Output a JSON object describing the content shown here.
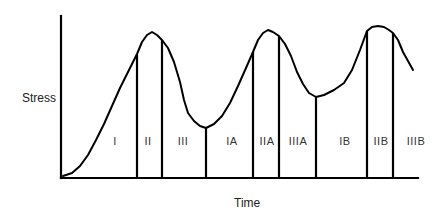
{
  "diagram": {
    "title": "",
    "y_axis_label": "Stress",
    "x_axis_label": "Time",
    "line_color": "#000000",
    "text_color": "#222222",
    "axes": {
      "origin": [
        61,
        178
      ],
      "y_axis_top": [
        61,
        16
      ],
      "x_axis_end": [
        418,
        178
      ]
    },
    "curve_points": [
      [
        63,
        176
      ],
      [
        72,
        173
      ],
      [
        80,
        166
      ],
      [
        88,
        155
      ],
      [
        96,
        140
      ],
      [
        104,
        124
      ],
      [
        112,
        106
      ],
      [
        120,
        88
      ],
      [
        128,
        72
      ],
      [
        134,
        60
      ],
      [
        137,
        54
      ],
      [
        142,
        42
      ],
      [
        147,
        35
      ],
      [
        152,
        32
      ],
      [
        157,
        35
      ],
      [
        162,
        40
      ],
      [
        168,
        48
      ],
      [
        174,
        62
      ],
      [
        180,
        82
      ],
      [
        184,
        100
      ],
      [
        188,
        113
      ],
      [
        194,
        121
      ],
      [
        200,
        126
      ],
      [
        206,
        128
      ],
      [
        214,
        124
      ],
      [
        222,
        116
      ],
      [
        230,
        103
      ],
      [
        238,
        86
      ],
      [
        246,
        68
      ],
      [
        253,
        52
      ],
      [
        258,
        40
      ],
      [
        263,
        33
      ],
      [
        268,
        30
      ],
      [
        273,
        32
      ],
      [
        279,
        36
      ],
      [
        285,
        44
      ],
      [
        291,
        56
      ],
      [
        297,
        72
      ],
      [
        303,
        84
      ],
      [
        309,
        93
      ],
      [
        316,
        97
      ],
      [
        324,
        95
      ],
      [
        334,
        90
      ],
      [
        344,
        83
      ],
      [
        352,
        70
      ],
      [
        360,
        50
      ],
      [
        367,
        31
      ],
      [
        372,
        27
      ],
      [
        378,
        26
      ],
      [
        384,
        27
      ],
      [
        389,
        30
      ],
      [
        393,
        33
      ],
      [
        398,
        40
      ],
      [
        403,
        52
      ],
      [
        408,
        61
      ],
      [
        413,
        70
      ]
    ],
    "dividers": [
      {
        "x": 137,
        "top": 54
      },
      {
        "x": 162,
        "top": 40
      },
      {
        "x": 206,
        "top": 128
      },
      {
        "x": 253,
        "top": 52
      },
      {
        "x": 279,
        "top": 36
      },
      {
        "x": 316,
        "top": 97
      },
      {
        "x": 367,
        "top": 31
      },
      {
        "x": 393,
        "top": 33
      }
    ],
    "phases": [
      {
        "label": "I",
        "x": 115
      },
      {
        "label": "II",
        "x": 148
      },
      {
        "label": "III",
        "x": 183
      },
      {
        "label": "IA",
        "x": 232
      },
      {
        "label": "IIA",
        "x": 267
      },
      {
        "label": "IIIA",
        "x": 298
      },
      {
        "label": "IB",
        "x": 345
      },
      {
        "label": "IIB",
        "x": 381
      },
      {
        "label": "IIIB",
        "x": 416
      }
    ]
  }
}
